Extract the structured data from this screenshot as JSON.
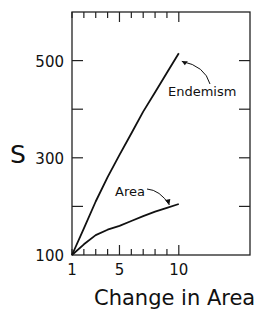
{
  "chart_data": {
    "type": "line",
    "title": "",
    "xlabel": "Change in Area",
    "ylabel": "S",
    "xlim": [
      1,
      16
    ],
    "ylim": [
      100,
      600
    ],
    "x_ticks": [
      1,
      5,
      10
    ],
    "x_tick_labels": [
      "1",
      "5",
      "10"
    ],
    "y_ticks": [
      100,
      300,
      500
    ],
    "y_tick_labels": [
      "100",
      "300",
      "500"
    ],
    "grid": false,
    "legend": "none (curves labeled with arrow annotations)",
    "series": [
      {
        "name": "Endemism",
        "x": [
          1,
          2,
          3,
          4,
          5,
          6,
          7,
          8,
          9,
          10
        ],
        "y": [
          100,
          155,
          210,
          260,
          306,
          350,
          395,
          435,
          475,
          515
        ]
      },
      {
        "name": "Area",
        "x": [
          1,
          2,
          3,
          4,
          5,
          6,
          7,
          8,
          9,
          10
        ],
        "y": [
          100,
          122,
          141,
          152,
          160,
          170,
          180,
          189,
          197,
          205
        ]
      }
    ],
    "annotations": [
      {
        "text": "Endemism",
        "points_to": [
          10,
          515
        ]
      },
      {
        "text": "Area",
        "points_to": [
          9.2,
          199
        ]
      }
    ]
  }
}
